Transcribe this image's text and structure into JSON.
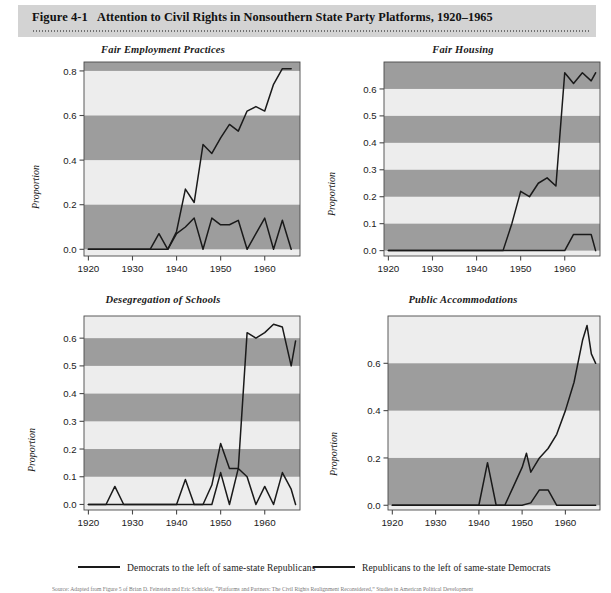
{
  "header": {
    "figure_number": "Figure 4-1",
    "title": "Attention to Civil Rights in Nonsouthern State Party Platforms, 1920–1965"
  },
  "legend": {
    "items": [
      {
        "label": "Democrats to the left of same-state Republicans",
        "color": "#1a1a1a"
      },
      {
        "label": "Republicans to the left of same-state Democrats",
        "color": "#1a1a1a"
      }
    ]
  },
  "source_note": "Source: Adapted from Figure 5 of Brian D. Feinstein and Eric Schickler, “Platforms and Partners: The Civil Rights Realignment Reconsidered,” Studies in American Political Development",
  "style": {
    "band_light": "#ededed",
    "band_dark": "#9d9d9d",
    "line_color": "#1a1a1a",
    "frame_color": "#4a4a4a",
    "header_band": "#d3d3d3"
  },
  "chart_data": [
    {
      "id": "fair-employment-practices",
      "type": "line",
      "title": "Fair Employment Practices",
      "xlabel": "",
      "ylabel": "Proportion",
      "xlim": [
        1919,
        1968
      ],
      "ylim": [
        -0.03,
        0.84
      ],
      "xticks": [
        1920,
        1930,
        1940,
        1950,
        1960
      ],
      "yticks": [
        0.0,
        0.2,
        0.4,
        0.6,
        0.8
      ],
      "grid": false,
      "bands": [
        [
          0.0,
          0.2
        ],
        [
          0.4,
          0.6
        ],
        [
          0.8,
          0.84
        ]
      ],
      "legend_position": "figure-bottom",
      "series": [
        {
          "name": "Democrats to the left of same-state Republicans",
          "x": [
            1920,
            1922,
            1924,
            1926,
            1928,
            1930,
            1932,
            1934,
            1936,
            1938,
            1940,
            1942,
            1944,
            1946,
            1948,
            1950,
            1952,
            1954,
            1956,
            1958,
            1960,
            1962,
            1964,
            1966
          ],
          "values": [
            0.0,
            0.0,
            0.0,
            0.0,
            0.0,
            0.0,
            0.0,
            0.0,
            0.07,
            0.0,
            0.08,
            0.27,
            0.21,
            0.47,
            0.43,
            0.5,
            0.56,
            0.53,
            0.62,
            0.64,
            0.62,
            0.74,
            0.81,
            0.81
          ]
        },
        {
          "name": "Republicans to the left of same-state Democrats",
          "x": [
            1920,
            1922,
            1924,
            1926,
            1928,
            1930,
            1932,
            1934,
            1936,
            1938,
            1940,
            1942,
            1944,
            1946,
            1948,
            1950,
            1952,
            1954,
            1956,
            1958,
            1960,
            1962,
            1964,
            1966
          ],
          "values": [
            0.0,
            0.0,
            0.0,
            0.0,
            0.0,
            0.0,
            0.0,
            0.0,
            0.0,
            0.0,
            0.07,
            0.1,
            0.14,
            0.0,
            0.14,
            0.11,
            0.11,
            0.13,
            0.0,
            0.07,
            0.14,
            0.0,
            0.13,
            0.0
          ]
        }
      ]
    },
    {
      "id": "fair-housing",
      "type": "line",
      "title": "Fair Housing",
      "xlabel": "",
      "ylabel": "Proportion",
      "xlim": [
        1919,
        1968
      ],
      "ylim": [
        -0.02,
        0.7
      ],
      "xticks": [
        1920,
        1930,
        1940,
        1950,
        1960
      ],
      "yticks": [
        0.0,
        0.1,
        0.2,
        0.3,
        0.4,
        0.5,
        0.6
      ],
      "grid": false,
      "bands": [
        [
          0.0,
          0.1
        ],
        [
          0.2,
          0.3
        ],
        [
          0.4,
          0.5
        ],
        [
          0.6,
          0.7
        ]
      ],
      "legend_position": "figure-bottom",
      "series": [
        {
          "name": "Democrats to the left of same-state Republicans",
          "x": [
            1920,
            1930,
            1940,
            1946,
            1948,
            1950,
            1952,
            1954,
            1956,
            1958,
            1960,
            1962,
            1964,
            1966,
            1967
          ],
          "values": [
            0.0,
            0.0,
            0.0,
            0.0,
            0.1,
            0.22,
            0.2,
            0.25,
            0.27,
            0.24,
            0.66,
            0.62,
            0.66,
            0.63,
            0.66
          ]
        },
        {
          "name": "Republicans to the left of same-state Democrats",
          "x": [
            1920,
            1930,
            1940,
            1950,
            1958,
            1960,
            1962,
            1964,
            1966,
            1967
          ],
          "values": [
            0.0,
            0.0,
            0.0,
            0.0,
            0.0,
            0.0,
            0.06,
            0.06,
            0.06,
            0.0
          ]
        }
      ]
    },
    {
      "id": "desegregation-of-schools",
      "type": "line",
      "title": "Desegregation of Schools",
      "xlabel": "",
      "ylabel": "Proportion",
      "xlim": [
        1919,
        1968
      ],
      "ylim": [
        -0.02,
        0.68
      ],
      "xticks": [
        1920,
        1930,
        1940,
        1950,
        1960
      ],
      "yticks": [
        0.0,
        0.1,
        0.2,
        0.3,
        0.4,
        0.5,
        0.6
      ],
      "grid": false,
      "bands": [
        [
          0.1,
          0.2
        ],
        [
          0.3,
          0.4
        ],
        [
          0.5,
          0.6
        ]
      ],
      "legend_position": "figure-bottom",
      "series": [
        {
          "name": "Democrats to the left of same-state Republicans",
          "x": [
            1920,
            1930,
            1940,
            1946,
            1948,
            1950,
            1952,
            1954,
            1956,
            1958,
            1960,
            1962,
            1964,
            1966,
            1967
          ],
          "values": [
            0.0,
            0.0,
            0.0,
            0.0,
            0.07,
            0.22,
            0.13,
            0.13,
            0.62,
            0.6,
            0.62,
            0.65,
            0.64,
            0.5,
            0.59
          ]
        },
        {
          "name": "Republicans to the left of same-state Democrats",
          "x": [
            1920,
            1924,
            1926,
            1928,
            1930,
            1940,
            1942,
            1944,
            1946,
            1948,
            1950,
            1952,
            1954,
            1956,
            1958,
            1960,
            1962,
            1964,
            1966,
            1967
          ],
          "values": [
            0.0,
            0.0,
            0.065,
            0.0,
            0.0,
            0.0,
            0.09,
            0.0,
            0.0,
            0.0,
            0.115,
            0.0,
            0.13,
            0.1,
            0.0,
            0.065,
            0.0,
            0.115,
            0.055,
            0.0
          ]
        }
      ]
    },
    {
      "id": "public-accommodations",
      "type": "line",
      "title": "Public Accommodations",
      "xlabel": "",
      "ylabel": "Proportion",
      "xlim": [
        1919,
        1968
      ],
      "ylim": [
        -0.02,
        0.8
      ],
      "xticks": [
        1920,
        1930,
        1940,
        1950,
        1960
      ],
      "yticks": [
        0.0,
        0.2,
        0.4,
        0.6
      ],
      "grid": false,
      "bands": [
        [
          0.0,
          0.2
        ],
        [
          0.4,
          0.6
        ]
      ],
      "legend_position": "figure-bottom",
      "series": [
        {
          "name": "Democrats to the left of same-state Republicans",
          "x": [
            1920,
            1930,
            1938,
            1940,
            1942,
            1944,
            1946,
            1948,
            1950,
            1951,
            1952,
            1954,
            1956,
            1958,
            1960,
            1962,
            1964,
            1965,
            1966,
            1967
          ],
          "values": [
            0.0,
            0.0,
            0.0,
            0.0,
            0.18,
            0.0,
            0.0,
            0.08,
            0.16,
            0.22,
            0.14,
            0.2,
            0.24,
            0.3,
            0.4,
            0.52,
            0.7,
            0.76,
            0.64,
            0.6
          ]
        },
        {
          "name": "Republicans to the left of same-state Democrats",
          "x": [
            1920,
            1930,
            1940,
            1950,
            1952,
            1954,
            1956,
            1958,
            1960,
            1967
          ],
          "values": [
            0.0,
            0.0,
            0.0,
            0.0,
            0.01,
            0.065,
            0.065,
            0.0,
            0.0,
            0.0
          ]
        }
      ]
    }
  ]
}
